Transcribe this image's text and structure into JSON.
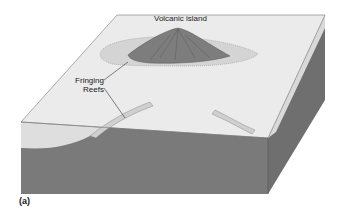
{
  "diagram": {
    "type": "block diagram",
    "labels": {
      "island": "Volcanic island",
      "reef_line1": "Fringing",
      "reef_line2": "Reefs",
      "panel": "(a)"
    },
    "colors": {
      "water_surface": "#e6e6e6",
      "water_side": "#d8d8d8",
      "seafloor_front": "#7a7a7a",
      "seafloor_side": "#6e6e6e",
      "island": "#7d7d7d",
      "reef": "#d2d2d2",
      "outline": "#555555"
    }
  }
}
